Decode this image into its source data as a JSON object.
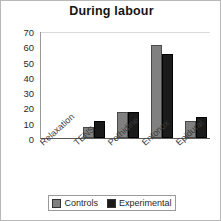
{
  "chart_data": {
    "type": "bar",
    "title": "During labour",
    "xlabel": "",
    "ylabel": "",
    "ylim": [
      0,
      70
    ],
    "yticks": [
      0,
      10,
      20,
      30,
      40,
      50,
      60,
      70
    ],
    "grid": true,
    "legend_position": "bottom",
    "categories": [
      "Relaxation",
      "TENS",
      "Pethidine",
      "Entonox",
      "Epidural"
    ],
    "series": [
      {
        "name": "Controls",
        "color": "#808080",
        "values": [
          0,
          7,
          17,
          61,
          11
        ]
      },
      {
        "name": "Experimental",
        "color": "#1a1a1a",
        "values": [
          0,
          11,
          17,
          55,
          14
        ]
      }
    ]
  },
  "legend": {
    "entries": [
      {
        "label": "Controls",
        "color": "#808080"
      },
      {
        "label": "Experimental",
        "color": "#1a1a1a"
      }
    ]
  }
}
